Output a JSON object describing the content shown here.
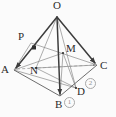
{
  "figure": {
    "type": "solid-geometry-diagram",
    "shape": "tetrahedron",
    "caption": "",
    "width": 116,
    "height": 117,
    "background_color": "#fbfbfb",
    "stroke_color": "#4a4a4a",
    "thin_stroke_color": "#8a8a8a",
    "dashed_stroke_color": "#9a9a9a",
    "label_color": "#2b2b2b",
    "annotation_color": "#8f8f8f"
  },
  "vertices": [
    {
      "id": "O",
      "label": "O",
      "x": 57,
      "y": 17,
      "label_x": 53,
      "label_y": 1,
      "kind": "apex"
    },
    {
      "id": "A",
      "label": "A",
      "x": 14,
      "y": 70,
      "label_x": 2,
      "label_y": 66,
      "kind": "base"
    },
    {
      "id": "B",
      "label": "B",
      "x": 60,
      "y": 96,
      "label_x": 54,
      "label_y": 99,
      "kind": "base"
    },
    {
      "id": "C",
      "label": "C",
      "x": 97,
      "y": 65,
      "label_x": 100,
      "label_y": 61,
      "kind": "base"
    }
  ],
  "points": [
    {
      "id": "P",
      "label": "P",
      "x": 31,
      "y": 43,
      "label_x": 18,
      "label_y": 31,
      "on": "OA"
    },
    {
      "id": "M",
      "label": "M",
      "x": 63,
      "y": 53,
      "label_x": 66,
      "label_y": 44,
      "on": "interior"
    },
    {
      "id": "N",
      "label": "N",
      "x": 36,
      "y": 68,
      "label_x": 31,
      "label_y": 66,
      "on": "interior"
    },
    {
      "id": "D",
      "label": "D",
      "x": 76,
      "y": 88,
      "label_x": 77,
      "label_y": 87,
      "on": "BC"
    }
  ],
  "edges": [
    {
      "from": "O",
      "to": "A",
      "style": "solid",
      "weight": "bold",
      "arrow": "end"
    },
    {
      "from": "O",
      "to": "B",
      "style": "solid",
      "weight": "bold",
      "arrow": "end"
    },
    {
      "from": "O",
      "to": "C",
      "style": "solid",
      "weight": "bold",
      "arrow": "end"
    },
    {
      "from": "A",
      "to": "B",
      "style": "solid",
      "weight": "thin",
      "arrow": "none"
    },
    {
      "from": "B",
      "to": "C",
      "style": "solid",
      "weight": "thin",
      "arrow": "none"
    },
    {
      "from": "A",
      "to": "C",
      "style": "dashed",
      "weight": "thin",
      "arrow": "end"
    }
  ],
  "construction_lines": [
    {
      "from": "P",
      "to": "C",
      "style": "solid",
      "weight": "thin",
      "note": "P to C through interior"
    },
    {
      "from": "A",
      "to": "M",
      "style": "solid",
      "weight": "thin",
      "note": "A to M"
    },
    {
      "from": "M",
      "to": "B",
      "style": "solid",
      "weight": "thin",
      "note": "M down to B"
    },
    {
      "from": "M",
      "to": "D",
      "style": "solid",
      "weight": "thin",
      "note": "M to D"
    },
    {
      "from": "N",
      "to": "O",
      "style": "solid",
      "weight": "thin",
      "note": "N up to O"
    },
    {
      "from": "N",
      "to": "C",
      "style": "solid",
      "weight": "thin",
      "note": "N to C"
    },
    {
      "from": "N",
      "to": "D",
      "style": "solid",
      "weight": "thin",
      "note": "N to D"
    },
    {
      "from": "A",
      "to": "D",
      "style": "solid",
      "weight": "thin",
      "note": "A to D"
    },
    {
      "from": "O",
      "to": "D",
      "style": "solid",
      "weight": "thin",
      "note": "O to D"
    }
  ],
  "right_angle_marks": [
    {
      "at_x": 33,
      "at_y": 47,
      "size": 4,
      "label": "right-angle-at-P"
    }
  ],
  "annotations": [
    {
      "id": "mark1",
      "text": "①",
      "number": "1",
      "x": 64,
      "y": 97,
      "style": "circled"
    },
    {
      "id": "mark2",
      "text": "②",
      "number": "2",
      "x": 85,
      "y": 78,
      "style": "circled"
    }
  ]
}
